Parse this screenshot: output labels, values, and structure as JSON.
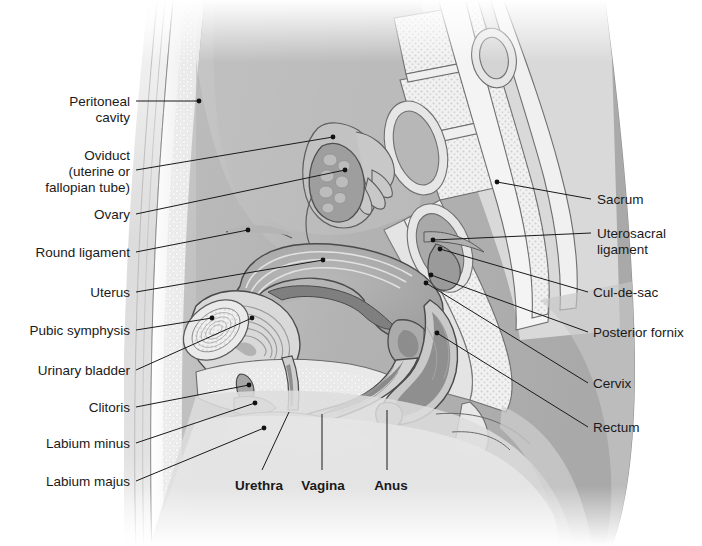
{
  "figure": {
    "kind": "anatomical-illustration",
    "view": "sagittal-section",
    "background_color": "#ffffff",
    "line_color": "#1a1a1a",
    "palette": {
      "skin_light": "#ededed",
      "tissue_light": "#dcdcdc",
      "tissue_mid": "#c4c4c4",
      "tissue_dark": "#a8a8a8",
      "muscle_dark": "#9a9a9a",
      "organ_shadow": "#8d8d8d",
      "bone_fill": "#f3f3f3",
      "cavity_fill": "#b5b5b5",
      "white": "#ffffff"
    }
  },
  "labels": {
    "left": [
      {
        "id": "peritoneal-cavity",
        "text": "Peritoneal\ncavity",
        "x": 52,
        "y": 94,
        "lines": 2
      },
      {
        "id": "oviduct",
        "text": "Oviduct\n(uterine or\nfallopian tube)",
        "x": 40,
        "y": 148,
        "lines": 3
      },
      {
        "id": "ovary",
        "text": "Ovary",
        "x": 82,
        "y": 207,
        "lines": 1
      },
      {
        "id": "round-ligament",
        "text": "Round ligament",
        "x": 22,
        "y": 245,
        "lines": 1
      },
      {
        "id": "uterus",
        "text": "Uterus",
        "x": 77,
        "y": 285,
        "lines": 1
      },
      {
        "id": "pubic-symphysis",
        "text": "Pubic symphysis",
        "x": 15,
        "y": 323,
        "lines": 1
      },
      {
        "id": "urinary-bladder",
        "text": "Urinary bladder",
        "x": 20,
        "y": 363,
        "lines": 1
      },
      {
        "id": "clitoris",
        "text": "Clitoris",
        "x": 72,
        "y": 400,
        "lines": 1
      },
      {
        "id": "labium-minus",
        "text": "Labium minus",
        "x": 32,
        "y": 436,
        "lines": 1
      },
      {
        "id": "labium-majus",
        "text": "Labium majus",
        "x": 32,
        "y": 474,
        "lines": 1
      }
    ],
    "right": [
      {
        "id": "sacrum",
        "text": "Sacrum",
        "x": 597,
        "y": 192,
        "lines": 1
      },
      {
        "id": "uterosacral-ligament",
        "text": "Uterosacral\nligament",
        "x": 597,
        "y": 226,
        "lines": 2
      },
      {
        "id": "cul-de-sac",
        "text": "Cul-de-sac",
        "x": 593,
        "y": 285,
        "lines": 1
      },
      {
        "id": "posterior-fornix",
        "text": "Posterior fornix",
        "x": 593,
        "y": 325,
        "lines": 1
      },
      {
        "id": "cervix",
        "text": "Cervix",
        "x": 593,
        "y": 376,
        "lines": 1
      },
      {
        "id": "rectum",
        "text": "Rectum",
        "x": 593,
        "y": 420,
        "lines": 1
      }
    ],
    "bottom": [
      {
        "id": "urethra",
        "text": "Urethra",
        "x": 239,
        "y": 478,
        "bold": true
      },
      {
        "id": "vagina",
        "text": "Vagina",
        "x": 303,
        "y": 478,
        "bold": true
      },
      {
        "id": "anus",
        "text": "Anus",
        "x": 371,
        "y": 478,
        "bold": true
      }
    ]
  },
  "leaders": {
    "description": "Thin black leader lines connecting each label to its anatomical structure; dots mark the anchor point on the structure.",
    "left": [
      {
        "id": "peritoneal-cavity",
        "from": [
          136,
          101
        ],
        "to": [
          199,
          101
        ],
        "dot": [
          199,
          101
        ]
      },
      {
        "id": "oviduct",
        "from": [
          136,
          170
        ],
        "to": [
          333,
          137
        ],
        "dot": [
          333,
          137
        ]
      },
      {
        "id": "ovary",
        "from": [
          136,
          214
        ],
        "to": [
          345,
          170
        ],
        "dot": [
          345,
          170
        ]
      },
      {
        "id": "round-ligament",
        "from": [
          136,
          252
        ],
        "to": [
          248,
          230
        ],
        "dot": [
          248,
          230
        ]
      },
      {
        "id": "uterus",
        "from": [
          136,
          292
        ],
        "to": [
          323,
          260
        ],
        "dot": [
          323,
          260
        ]
      },
      {
        "id": "pubic-symphysis",
        "from": [
          136,
          330
        ],
        "to": [
          212,
          318
        ],
        "dot": [
          212,
          318
        ]
      },
      {
        "id": "urinary-bladder",
        "from": [
          136,
          370
        ],
        "to": [
          252,
          318
        ],
        "dot": [
          252,
          318
        ]
      },
      {
        "id": "clitoris",
        "from": [
          136,
          407
        ],
        "to": [
          249,
          385
        ],
        "dot": [
          249,
          385
        ]
      },
      {
        "id": "labium-minus",
        "from": [
          136,
          443
        ],
        "to": [
          255,
          403
        ],
        "dot": [
          255,
          403
        ]
      },
      {
        "id": "labium-majus",
        "from": [
          136,
          481
        ],
        "to": [
          264,
          428
        ],
        "dot": [
          264,
          428
        ]
      }
    ],
    "right": [
      {
        "id": "sacrum",
        "from": [
          591,
          199
        ],
        "to": [
          497,
          182
        ],
        "dot": [
          497,
          182
        ]
      },
      {
        "id": "uterosacral-ligament",
        "from": [
          591,
          233
        ],
        "to": [
          433,
          240
        ],
        "dot": [
          433,
          240
        ]
      },
      {
        "id": "cul-de-sac",
        "from": [
          588,
          292
        ],
        "to": [
          440,
          249
        ],
        "dot": [
          440,
          249
        ]
      },
      {
        "id": "posterior-fornix",
        "from": [
          588,
          332
        ],
        "to": [
          431,
          275
        ],
        "dot": [
          431,
          275
        ]
      },
      {
        "id": "cervix",
        "from": [
          588,
          383
        ],
        "to": [
          426,
          283
        ],
        "dot": [
          426,
          283
        ]
      },
      {
        "id": "rectum",
        "from": [
          588,
          427
        ],
        "to": [
          437,
          333
        ],
        "dot": [
          437,
          333
        ]
      }
    ],
    "bottom": [
      {
        "id": "urethra",
        "from": [
          262,
          470
        ],
        "to": [
          289,
          412
        ]
      },
      {
        "id": "vagina",
        "from": [
          322,
          470
        ],
        "to": [
          322,
          414
        ]
      },
      {
        "id": "anus",
        "from": [
          387,
          470
        ],
        "to": [
          387,
          410
        ]
      }
    ]
  }
}
